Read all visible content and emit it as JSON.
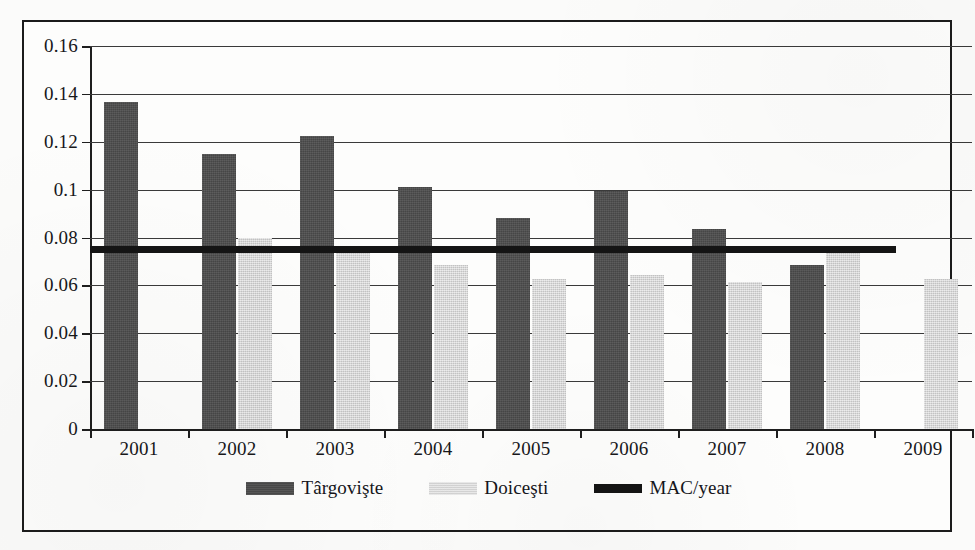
{
  "chart_data": {
    "type": "bar",
    "title": "",
    "subtitle": "",
    "xlabel": "",
    "ylabel": "",
    "categories": [
      "2001",
      "2002",
      "2003",
      "2004",
      "2005",
      "2006",
      "2007",
      "2008",
      "2009"
    ],
    "ylim": [
      0,
      0.16
    ],
    "xlim_note": "categorical year axis",
    "yticks": [
      0,
      0.02,
      0.04,
      0.06,
      0.08,
      0.1,
      0.12,
      0.14,
      0.16
    ],
    "ytick_labels": [
      "0",
      "0.02",
      "0.04",
      "0.06",
      "0.08",
      "0.1",
      "0.12",
      "0.14",
      "0.16"
    ],
    "grid": true,
    "grid_axis": "y",
    "legend_position": "bottom-center",
    "series": [
      {
        "name": "Târgovişte",
        "kind": "bar",
        "color": "#4d4d4d",
        "values": [
          0.1365,
          0.115,
          0.1225,
          0.101,
          0.088,
          0.0995,
          0.0835,
          0.0685,
          null
        ]
      },
      {
        "name": "Doiceşti",
        "kind": "bar",
        "color": "#d6d6d6",
        "values": [
          null,
          0.08,
          0.074,
          0.0685,
          0.0625,
          0.0645,
          0.0615,
          0.0735,
          0.0625
        ]
      },
      {
        "name": "MAC/year",
        "kind": "threshold-line",
        "color": "#141414",
        "value": 0.075,
        "spans_categories": [
          "2001",
          "2009"
        ]
      }
    ]
  },
  "legend": {
    "items": [
      {
        "label": "Târgovişte",
        "swatch": "dark-gray-bar-swatch"
      },
      {
        "label": "Doiceşti",
        "swatch": "light-gray-bar-swatch"
      },
      {
        "label": "MAC/year",
        "swatch": "black-line-swatch"
      }
    ]
  },
  "axes": {
    "y_labels": [
      "0.16",
      "0.14",
      "0.12",
      "0.1",
      "0.08",
      "0.06",
      "0.04",
      "0.02",
      "0"
    ],
    "x_labels": [
      "2001",
      "2002",
      "2003",
      "2004",
      "2005",
      "2006",
      "2007",
      "2008",
      "2009"
    ]
  },
  "colors": {
    "series_targoviste": "#4d4d4d",
    "series_doicesti": "#d6d6d6",
    "mac_line": "#141414",
    "axis": "#1e1e1e",
    "gridline": "#3a3a3a",
    "frame": "#1b1b1b",
    "paper": "#fbfbfa"
  }
}
